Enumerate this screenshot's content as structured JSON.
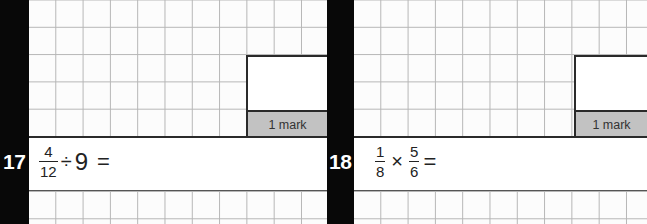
{
  "questions": [
    {
      "number": "17",
      "expression": {
        "fraction": {
          "numerator": "4",
          "denominator": "12"
        },
        "operator": "÷",
        "operand": "9",
        "equals": "="
      },
      "mark_label": "1 mark"
    },
    {
      "number": "18",
      "expression": {
        "fraction1": {
          "numerator": "1",
          "denominator": "8"
        },
        "operator": "×",
        "fraction2": {
          "numerator": "5",
          "denominator": "6"
        },
        "equals": "="
      },
      "mark_label": "1 mark"
    }
  ],
  "colors": {
    "strip": "#080808",
    "grid_line": "#b5b5b5",
    "mark_fill": "#c2c2c2",
    "border": "#2a2a2a"
  }
}
